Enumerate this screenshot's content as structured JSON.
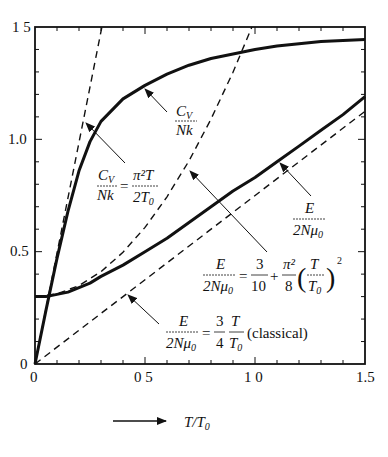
{
  "chart_data": {
    "type": "line",
    "title": "",
    "xlabel": "T/T0",
    "ylabel": "",
    "xlim": [
      0,
      1.5
    ],
    "ylim": [
      0,
      1.5
    ],
    "grid": false,
    "x_ticks": [
      "0",
      "0.5",
      "1.0",
      "1.5"
    ],
    "y_ticks": [
      "0",
      "0.5",
      "1.0",
      "1.5"
    ],
    "x_tick_labels_display": [
      "0",
      "0 5",
      "1 0",
      "1.5"
    ],
    "y_tick_labels_display": [
      "0",
      "0.5",
      "1.0",
      "1 5"
    ],
    "series": [
      {
        "name": "Cv/Nk",
        "style": "solid-thick",
        "x": [
          0,
          0.05,
          0.1,
          0.15,
          0.2,
          0.25,
          0.3,
          0.4,
          0.5,
          0.6,
          0.7,
          0.8,
          0.9,
          1.0,
          1.1,
          1.2,
          1.3,
          1.4,
          1.5
        ],
        "y": [
          0,
          0.24,
          0.47,
          0.68,
          0.86,
          0.99,
          1.08,
          1.18,
          1.24,
          1.29,
          1.33,
          1.36,
          1.38,
          1.4,
          1.415,
          1.425,
          1.435,
          1.44,
          1.445
        ]
      },
      {
        "name": "Cv/Nk = π²T/2T0",
        "style": "dashed",
        "x": [
          0,
          0.304
        ],
        "y": [
          0,
          1.5
        ]
      },
      {
        "name": "E/2Nμ0",
        "style": "solid-thick",
        "x": [
          0,
          0.05,
          0.1,
          0.15,
          0.2,
          0.25,
          0.3,
          0.4,
          0.5,
          0.6,
          0.7,
          0.8,
          0.9,
          1.0,
          1.1,
          1.2,
          1.3,
          1.4,
          1.5
        ],
        "y": [
          0.3,
          0.3,
          0.31,
          0.32,
          0.34,
          0.36,
          0.39,
          0.44,
          0.5,
          0.56,
          0.63,
          0.7,
          0.77,
          0.83,
          0.9,
          0.97,
          1.04,
          1.11,
          1.19
        ]
      },
      {
        "name": "E/2Nμ0 = 3/10 + π²/8 (T/T0)²",
        "style": "dashed",
        "x": [
          0,
          0.1,
          0.2,
          0.3,
          0.4,
          0.5,
          0.6,
          0.7,
          0.8,
          0.9,
          0.986
        ],
        "y": [
          0.3,
          0.312,
          0.349,
          0.411,
          0.497,
          0.608,
          0.744,
          0.904,
          1.09,
          1.299,
          1.5
        ]
      },
      {
        "name": "E/2Nμ0 = 3/4 T/T0 (classical)",
        "style": "dashed",
        "x": [
          0,
          1.5
        ],
        "y": [
          0,
          1.125
        ]
      }
    ],
    "annotations": [
      {
        "text": "Cv/Nk",
        "target": "Cv/Nk solid curve",
        "arrow": true
      },
      {
        "text": "Cv/Nk = π²T/2T0",
        "target": "linear dashed line",
        "arrow": true
      },
      {
        "text": "E/2Nμ0",
        "target": "E/2Nμ0 solid curve",
        "arrow": true
      },
      {
        "text": "E/2Nμ0 = 3/10 + π²/8 (T/T0)²",
        "target": "quadratic dashed curve",
        "arrow": true
      },
      {
        "text": "E/2Nμ0 = 3/4 T/T0 (classical)",
        "target": "classical dashed line",
        "arrow": true
      }
    ]
  },
  "axes": {
    "x_label": "T/T0",
    "x_label_num": "T",
    "x_label_sep": "/",
    "x_label_den": "T",
    "x_label_den_sub": "0",
    "x_ticks": [
      "0",
      "0 5",
      "1 0",
      "1.5"
    ],
    "y_ticks": [
      "0",
      "0.5",
      "1.0",
      "1 5"
    ]
  },
  "labels": {
    "cv": {
      "num": "Cv",
      "num_main": "C",
      "num_sub": "V",
      "den": "Nk"
    },
    "cv_lin": {
      "lhs_num_main": "C",
      "lhs_num_sub": "V",
      "lhs_den": "Nk",
      "eq": "=",
      "rhs_num": "π²T",
      "rhs_den_main": "2T",
      "rhs_den_sub": "0"
    },
    "e": {
      "num": "E",
      "den_main": "2Nμ",
      "den_sub": "0"
    },
    "e_quad": {
      "lhs_num": "E",
      "lhs_den_main": "2Nμ",
      "lhs_den_sub": "0",
      "eq": "=",
      "frac1_num": "3",
      "frac1_den": "10",
      "plus": "+",
      "frac2_num": "π²",
      "frac2_den": "8",
      "paren_num": "T",
      "paren_den_main": "T",
      "paren_den_sub": "0",
      "exp": "2"
    },
    "e_classical": {
      "lhs_num": "E",
      "lhs_den_main": "2Nμ",
      "lhs_den_sub": "0",
      "eq": "=",
      "frac1_num": "3",
      "frac1_den": "4",
      "frac2_num": "T",
      "frac2_den_main": "T",
      "frac2_den_sub": "0",
      "suffix": "(classical)"
    }
  }
}
